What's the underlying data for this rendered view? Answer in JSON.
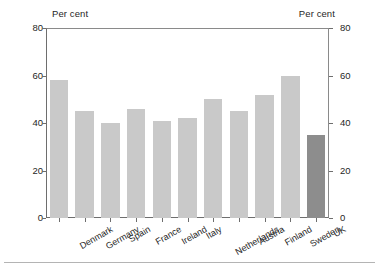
{
  "chart_data": {
    "type": "bar",
    "title": "",
    "subtitle": "",
    "xlabel": "",
    "ylabel": "Per cent",
    "ylabel_right": "Per cent",
    "ylim": [
      0,
      80
    ],
    "yticks": [
      0,
      20,
      40,
      60,
      80
    ],
    "grid": false,
    "legend": null,
    "categories": [
      "Denmark",
      "Germany",
      "Spain",
      "France",
      "Ireland",
      "Italy",
      "Netherlands",
      "Austria",
      "Finland",
      "Sweden",
      "UK"
    ],
    "values": [
      58,
      45,
      40,
      46,
      41,
      42,
      50,
      45,
      52,
      60,
      35
    ],
    "highlight_category": "UK",
    "colors": {
      "bar": "#c9c9c9",
      "bar_highlight": "#8d8d8d",
      "axis": "#6e6e6e",
      "text": "#1f1f1f",
      "background": "#ffffff",
      "rule": "#b4b4b4"
    }
  },
  "axis": {
    "units_left": "Per cent",
    "units_right": "Per cent",
    "tick_labels": [
      "80",
      "60",
      "40",
      "20",
      "0"
    ]
  }
}
